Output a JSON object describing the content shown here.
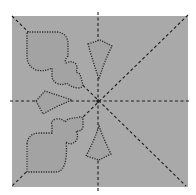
{
  "diagram": {
    "type": "paper-folding-cut-pattern",
    "colors": {
      "background": "#ffffff",
      "paper": "#a9a9a9",
      "fold_line": "#1e1e1e",
      "cut_line": "#2a2a2a"
    },
    "paper_bounds": {
      "x": 12,
      "y": 16,
      "width": 176,
      "height": 171
    },
    "center": {
      "x": 98,
      "y": 101
    },
    "fold_lines": [
      "vertical",
      "horizontal",
      "diagonal-tl-br",
      "diagonal-tr-bl"
    ],
    "cutouts": [
      "spade-club-top-left",
      "kite-top",
      "diamond-left",
      "spade-club-bottom-left",
      "kite-bottom"
    ]
  }
}
